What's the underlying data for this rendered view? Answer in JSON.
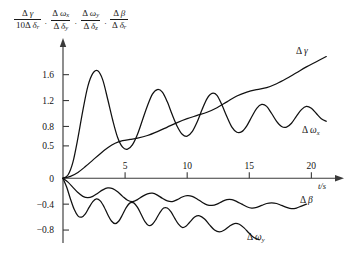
{
  "chart_data": {
    "type": "line",
    "title": "",
    "xlabel": "t/s",
    "ylabel": "Δγ/(10Δδr) , Δωx/Δδy , Δωy/Δδz , Δβ/Δδr",
    "xlim": [
      0,
      21.5
    ],
    "ylim": [
      -1.0,
      1.95
    ],
    "xticks": [
      "5",
      "10",
      "15",
      "20"
    ],
    "xtick_values": [
      5,
      10,
      15,
      20
    ],
    "yticks": [
      "1.6",
      "1.2",
      "0.8",
      "0.5",
      "0",
      "-0.4",
      "-0.8"
    ],
    "ytick_values": [
      1.6,
      1.2,
      0.8,
      0.5,
      0,
      -0.4,
      -0.8
    ],
    "grid": false,
    "legend": "inline-curve-labels",
    "series": [
      {
        "name": "Δγ",
        "label": "delta-gamma",
        "points": [
          [
            0.0,
            0.0
          ],
          [
            0.6,
            0.03
          ],
          [
            1.2,
            0.09
          ],
          [
            1.8,
            0.18
          ],
          [
            2.4,
            0.28
          ],
          [
            3.0,
            0.38
          ],
          [
            3.6,
            0.47
          ],
          [
            4.2,
            0.54
          ],
          [
            4.8,
            0.58
          ],
          [
            5.4,
            0.6
          ],
          [
            6.0,
            0.62
          ],
          [
            6.8,
            0.66
          ],
          [
            7.6,
            0.72
          ],
          [
            8.4,
            0.79
          ],
          [
            9.2,
            0.86
          ],
          [
            10.0,
            0.92
          ],
          [
            10.8,
            0.97
          ],
          [
            11.6,
            1.02
          ],
          [
            12.4,
            1.09
          ],
          [
            13.2,
            1.18
          ],
          [
            14.0,
            1.27
          ],
          [
            14.8,
            1.33
          ],
          [
            15.6,
            1.37
          ],
          [
            16.4,
            1.4
          ],
          [
            17.2,
            1.46
          ],
          [
            18.0,
            1.54
          ],
          [
            18.8,
            1.63
          ],
          [
            19.6,
            1.72
          ],
          [
            20.4,
            1.8
          ],
          [
            21.2,
            1.88
          ]
        ]
      },
      {
        "name": "Δωx",
        "label": "delta-omega-x",
        "points": [
          [
            0.0,
            0.0
          ],
          [
            0.4,
            0.05
          ],
          [
            0.8,
            0.25
          ],
          [
            1.2,
            0.62
          ],
          [
            1.6,
            1.05
          ],
          [
            2.0,
            1.42
          ],
          [
            2.4,
            1.62
          ],
          [
            2.8,
            1.66
          ],
          [
            3.2,
            1.52
          ],
          [
            3.6,
            1.22
          ],
          [
            4.0,
            0.9
          ],
          [
            4.4,
            0.63
          ],
          [
            4.8,
            0.48
          ],
          [
            5.2,
            0.45
          ],
          [
            5.6,
            0.52
          ],
          [
            6.0,
            0.68
          ],
          [
            6.4,
            0.9
          ],
          [
            6.8,
            1.12
          ],
          [
            7.2,
            1.3
          ],
          [
            7.6,
            1.37
          ],
          [
            8.0,
            1.33
          ],
          [
            8.4,
            1.18
          ],
          [
            8.8,
            0.98
          ],
          [
            9.2,
            0.8
          ],
          [
            9.6,
            0.68
          ],
          [
            10.0,
            0.65
          ],
          [
            10.4,
            0.72
          ],
          [
            10.8,
            0.87
          ],
          [
            11.2,
            1.06
          ],
          [
            11.6,
            1.23
          ],
          [
            12.0,
            1.31
          ],
          [
            12.4,
            1.28
          ],
          [
            12.8,
            1.13
          ],
          [
            13.2,
            0.95
          ],
          [
            13.6,
            0.79
          ],
          [
            14.0,
            0.71
          ],
          [
            14.4,
            0.72
          ],
          [
            14.8,
            0.81
          ],
          [
            15.2,
            0.95
          ],
          [
            15.6,
            1.08
          ],
          [
            16.0,
            1.14
          ],
          [
            16.4,
            1.11
          ],
          [
            16.8,
            1.0
          ],
          [
            17.2,
            0.88
          ],
          [
            17.6,
            0.8
          ],
          [
            18.0,
            0.79
          ],
          [
            18.4,
            0.85
          ],
          [
            18.8,
            0.96
          ],
          [
            19.2,
            1.06
          ],
          [
            19.6,
            1.11
          ],
          [
            20.0,
            1.08
          ],
          [
            20.4,
            1.0
          ],
          [
            20.8,
            0.92
          ],
          [
            21.2,
            0.88
          ]
        ]
      },
      {
        "name": "Δβ",
        "label": "delta-beta",
        "points": [
          [
            0.0,
            0.0
          ],
          [
            0.4,
            -0.06
          ],
          [
            0.8,
            -0.14
          ],
          [
            1.2,
            -0.22
          ],
          [
            1.6,
            -0.28
          ],
          [
            2.0,
            -0.3
          ],
          [
            2.4,
            -0.28
          ],
          [
            2.8,
            -0.23
          ],
          [
            3.2,
            -0.18
          ],
          [
            3.6,
            -0.15
          ],
          [
            4.0,
            -0.16
          ],
          [
            4.4,
            -0.21
          ],
          [
            4.8,
            -0.28
          ],
          [
            5.2,
            -0.34
          ],
          [
            5.6,
            -0.36
          ],
          [
            6.0,
            -0.33
          ],
          [
            6.4,
            -0.28
          ],
          [
            6.8,
            -0.24
          ],
          [
            7.2,
            -0.23
          ],
          [
            7.6,
            -0.26
          ],
          [
            8.0,
            -0.31
          ],
          [
            8.4,
            -0.35
          ],
          [
            8.8,
            -0.36
          ],
          [
            9.2,
            -0.33
          ],
          [
            9.6,
            -0.29
          ],
          [
            10.0,
            -0.27
          ],
          [
            10.4,
            -0.28
          ],
          [
            10.8,
            -0.32
          ],
          [
            11.2,
            -0.37
          ],
          [
            11.6,
            -0.41
          ],
          [
            12.0,
            -0.42
          ],
          [
            12.4,
            -0.4
          ],
          [
            12.8,
            -0.36
          ],
          [
            13.2,
            -0.33
          ],
          [
            13.6,
            -0.33
          ],
          [
            14.0,
            -0.36
          ],
          [
            14.4,
            -0.4
          ],
          [
            14.8,
            -0.44
          ],
          [
            15.2,
            -0.46
          ],
          [
            15.6,
            -0.45
          ],
          [
            16.0,
            -0.42
          ],
          [
            16.4,
            -0.39
          ],
          [
            16.8,
            -0.38
          ],
          [
            17.2,
            -0.39
          ],
          [
            17.6,
            -0.42
          ],
          [
            18.0,
            -0.45
          ],
          [
            18.4,
            -0.47
          ],
          [
            18.8,
            -0.46
          ],
          [
            19.2,
            -0.43
          ],
          [
            19.6,
            -0.4
          ]
        ]
      },
      {
        "name": "Δωy",
        "label": "delta-omega-y",
        "points": [
          [
            0.0,
            0.0
          ],
          [
            0.3,
            -0.14
          ],
          [
            0.6,
            -0.32
          ],
          [
            0.9,
            -0.48
          ],
          [
            1.2,
            -0.58
          ],
          [
            1.5,
            -0.6
          ],
          [
            1.8,
            -0.55
          ],
          [
            2.1,
            -0.45
          ],
          [
            2.4,
            -0.36
          ],
          [
            2.7,
            -0.32
          ],
          [
            3.0,
            -0.35
          ],
          [
            3.3,
            -0.44
          ],
          [
            3.6,
            -0.56
          ],
          [
            3.9,
            -0.66
          ],
          [
            4.2,
            -0.7
          ],
          [
            4.5,
            -0.66
          ],
          [
            4.8,
            -0.56
          ],
          [
            5.1,
            -0.45
          ],
          [
            5.4,
            -0.38
          ],
          [
            5.7,
            -0.38
          ],
          [
            6.0,
            -0.45
          ],
          [
            6.3,
            -0.56
          ],
          [
            6.6,
            -0.67
          ],
          [
            6.9,
            -0.73
          ],
          [
            7.2,
            -0.71
          ],
          [
            7.5,
            -0.63
          ],
          [
            7.8,
            -0.53
          ],
          [
            8.1,
            -0.46
          ],
          [
            8.4,
            -0.46
          ],
          [
            8.7,
            -0.52
          ],
          [
            9.0,
            -0.62
          ],
          [
            9.3,
            -0.71
          ],
          [
            9.6,
            -0.76
          ],
          [
            9.9,
            -0.74
          ],
          [
            10.2,
            -0.68
          ],
          [
            10.6,
            -0.6
          ],
          [
            11.0,
            -0.58
          ],
          [
            11.4,
            -0.63
          ],
          [
            11.8,
            -0.72
          ],
          [
            12.2,
            -0.8
          ],
          [
            12.6,
            -0.83
          ],
          [
            13.0,
            -0.8
          ],
          [
            13.4,
            -0.74
          ],
          [
            13.8,
            -0.7
          ],
          [
            14.2,
            -0.71
          ],
          [
            14.6,
            -0.77
          ],
          [
            15.0,
            -0.85
          ],
          [
            15.4,
            -0.92
          ],
          [
            15.8,
            -0.95
          ]
        ]
      }
    ]
  },
  "ylabel_parts": {
    "f1": {
      "num_delta": "Δ",
      "num_var": "γ",
      "den_coef": "10",
      "den_delta": "Δ",
      "den_var": "δ",
      "den_sub": "r"
    },
    "f2": {
      "num_delta": "Δ",
      "num_var": "ω",
      "num_sub": "x",
      "den_delta": "Δ",
      "den_var": "δ",
      "den_sub": "y"
    },
    "f3": {
      "num_delta": "Δ",
      "num_var": "ω",
      "num_sub": "y",
      "den_delta": "Δ",
      "den_var": "δ",
      "den_sub": "z"
    },
    "f4": {
      "num_delta": "Δ",
      "num_var": "β",
      "den_delta": "Δ",
      "den_var": "δ",
      "den_sub": "r"
    },
    "sep": "·"
  },
  "curve_labels": {
    "gamma": {
      "d": "Δ",
      "v": "γ"
    },
    "omega_x": {
      "d": "Δ",
      "v": "ω",
      "s": "x"
    },
    "omega_y": {
      "d": "Δ",
      "v": "ω",
      "s": "y"
    },
    "beta": {
      "d": "Δ",
      "v": "β"
    }
  },
  "axis": {
    "x_unit": "t/s"
  },
  "colors": {
    "curve": "#111111",
    "axis": "#3a3a3a",
    "background": "#ffffff"
  }
}
